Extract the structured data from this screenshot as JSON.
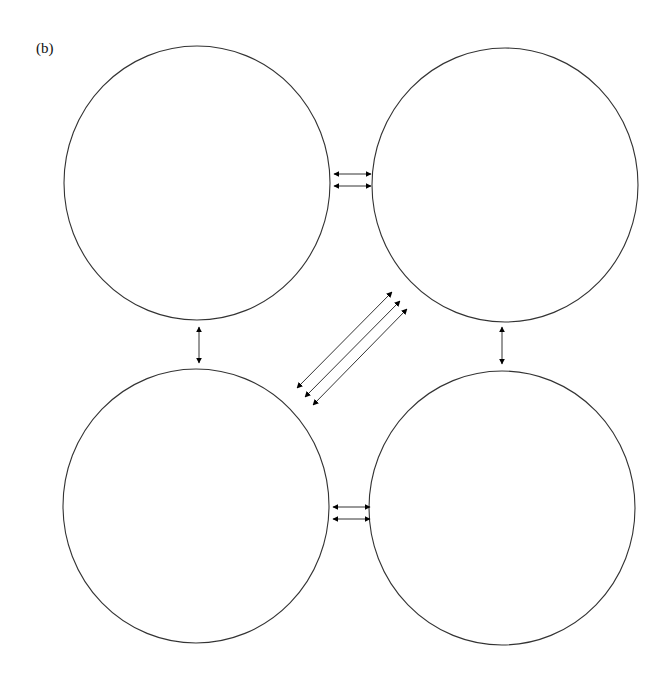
{
  "figure": {
    "panel_label": "(b)",
    "stroke_color": "#333333",
    "arrow_color": "#000000",
    "background": "#ffffff"
  },
  "circles": [
    {
      "id": "top-left",
      "cx": 197,
      "cy": 183,
      "rx": 133,
      "ry": 137
    },
    {
      "id": "top-right",
      "cx": 505,
      "cy": 185,
      "rx": 133,
      "ry": 137
    },
    {
      "id": "bottom-left",
      "cx": 196,
      "cy": 506,
      "rx": 133,
      "ry": 137
    },
    {
      "id": "bottom-right",
      "cx": 502,
      "cy": 508,
      "rx": 133,
      "ry": 137
    }
  ],
  "arrows": [
    {
      "id": "top-horizontal-1",
      "x1": 334,
      "y1": 174,
      "x2": 371,
      "y2": 174
    },
    {
      "id": "top-horizontal-2",
      "x1": 334,
      "y1": 186,
      "x2": 371,
      "y2": 186
    },
    {
      "id": "bottom-horizontal-1",
      "x1": 333,
      "y1": 507,
      "x2": 370,
      "y2": 507
    },
    {
      "id": "bottom-horizontal-2",
      "x1": 333,
      "y1": 519,
      "x2": 370,
      "y2": 519
    },
    {
      "id": "left-vertical",
      "x1": 199,
      "y1": 327,
      "x2": 199,
      "y2": 363
    },
    {
      "id": "right-vertical",
      "x1": 502,
      "y1": 327,
      "x2": 502,
      "y2": 364
    },
    {
      "id": "diagonal-1",
      "x1": 297,
      "y1": 388,
      "x2": 392,
      "y2": 292
    },
    {
      "id": "diagonal-2",
      "x1": 305,
      "y1": 397,
      "x2": 400,
      "y2": 301
    },
    {
      "id": "diagonal-3",
      "x1": 313,
      "y1": 405,
      "x2": 407,
      "y2": 309
    }
  ]
}
